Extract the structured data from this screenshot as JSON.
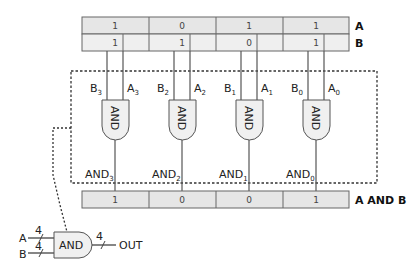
{
  "register_a": {
    "label": "A",
    "bits": [
      "1",
      "0",
      "1",
      "1"
    ]
  },
  "register_b": {
    "label": "B",
    "bits": [
      "1",
      "1",
      "0",
      "1"
    ]
  },
  "result": {
    "label": "A AND B",
    "bits": [
      "1",
      "0",
      "0",
      "1"
    ]
  },
  "gates": [
    {
      "label": "AND",
      "in_b": "B",
      "in_b_sub": "3",
      "in_a": "A",
      "in_a_sub": "3",
      "out": "AND",
      "out_sub": "3"
    },
    {
      "label": "AND",
      "in_b": "B",
      "in_b_sub": "2",
      "in_a": "A",
      "in_a_sub": "2",
      "out": "AND",
      "out_sub": "2"
    },
    {
      "label": "AND",
      "in_b": "B",
      "in_b_sub": "1",
      "in_a": "A",
      "in_a_sub": "1",
      "out": "AND",
      "out_sub": "1"
    },
    {
      "label": "AND",
      "in_b": "B",
      "in_b_sub": "0",
      "in_a": "A",
      "in_a_sub": "0",
      "out": "AND",
      "out_sub": "0"
    }
  ],
  "symbol": {
    "gate_label": "AND",
    "input_a": "A",
    "input_a_width": "4",
    "input_b": "B",
    "input_b_width": "4",
    "output": "OUT",
    "output_width": "4"
  }
}
